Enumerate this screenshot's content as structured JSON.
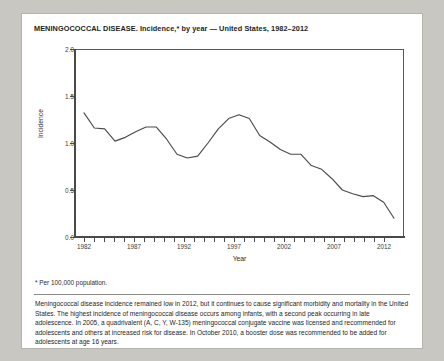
{
  "figure": {
    "title": "MENINGOCOCCAL DISEASE. Incidence,* by year — United States, 1982–2012",
    "footnote": "* Per 100,000 population.",
    "body_text": "Meningococcal disease incidence remained low in 2012, but it continues to cause significant morbidity and mortality in the United States.  The highest incidence of meningococcal disease occurs among infants, with a second peak occurring in late adolescence.  In 2005, a quadrivalent (A, C, Y, W-135) meningococcal conjugate vaccine was licensed and recommended for adolescents and others at increased risk for disease.  In October 2010, a booster dose was recommended to be added for adolescents at age 16 years."
  },
  "chart_data": {
    "type": "line",
    "title": "MENINGOCOCCAL DISEASE. Incidence,* by year — United States, 1982–2012",
    "xlabel": "Year",
    "ylabel": "Incidence",
    "xlim": [
      1981,
      2013
    ],
    "ylim": [
      0.0,
      2.0
    ],
    "ytick_labels": [
      "0.0",
      "0.5",
      "1.0",
      "1.5",
      "2.0"
    ],
    "ytick_values": [
      0.0,
      0.5,
      1.0,
      1.5,
      2.0
    ],
    "xtick_labels": [
      "1982",
      "1987",
      "1992",
      "1997",
      "2002",
      "2007",
      "2012"
    ],
    "xtick_values": [
      1982,
      1987,
      1992,
      1997,
      2002,
      2007,
      2012
    ],
    "xtick_minor_step": 1,
    "grid": false,
    "legend": null,
    "line_color": "#4a4a4a",
    "x": [
      1982,
      1983,
      1984,
      1985,
      1986,
      1987,
      1988,
      1989,
      1990,
      1991,
      1992,
      1993,
      1994,
      1995,
      1996,
      1997,
      1998,
      1999,
      2000,
      2001,
      2002,
      2003,
      2004,
      2005,
      2006,
      2007,
      2008,
      2009,
      2010,
      2011,
      2012
    ],
    "values": [
      1.32,
      1.16,
      1.15,
      1.02,
      1.06,
      1.12,
      1.17,
      1.17,
      1.04,
      0.88,
      0.84,
      0.86,
      1.0,
      1.15,
      1.26,
      1.3,
      1.26,
      1.08,
      1.01,
      0.93,
      0.88,
      0.88,
      0.76,
      0.72,
      0.62,
      0.5,
      0.46,
      0.43,
      0.44,
      0.37,
      0.2
    ]
  }
}
